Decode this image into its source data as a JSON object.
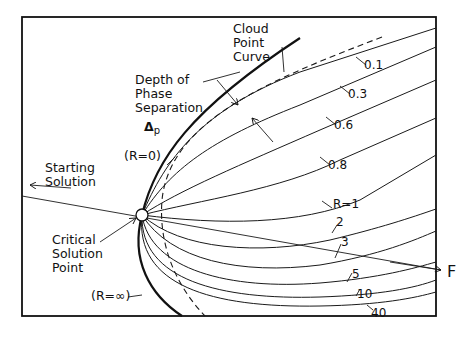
{
  "diagram": {
    "labels": {
      "cloud_point_curve": [
        "Cloud",
        "Point",
        "Curve"
      ],
      "depth": [
        "Depth of",
        "Phase",
        "Separation"
      ],
      "delta": "Δ",
      "delta_sub": "p",
      "r_zero": "(R=0)",
      "r_inf": "(R=∞)",
      "starting_solution": [
        "Starting",
        "Solution"
      ],
      "critical_point": [
        "Critical",
        "Solution",
        "Point"
      ],
      "f_axis": "F"
    },
    "curve_labels": [
      "0.1",
      "0.3",
      "0.6",
      "0.8",
      "R=1",
      "2",
      "3",
      "5",
      "10",
      "40"
    ]
  }
}
